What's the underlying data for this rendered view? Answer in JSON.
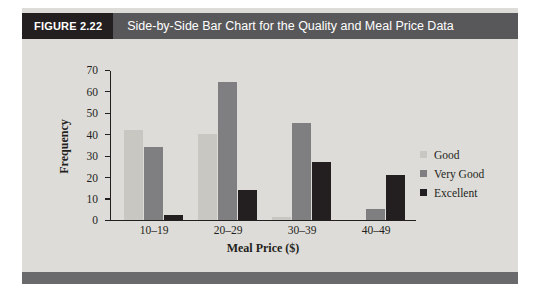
{
  "figure": {
    "tag": "FIGURE 2.22",
    "caption": "Side-by-Side Bar Chart for the Quality and Meal Price Data",
    "tag_bg": "#231f20",
    "band_bg": "#58585a",
    "footer_bg": "#6a6a6c",
    "page_bg": "#dedcd8"
  },
  "chart_data": {
    "type": "bar",
    "title": "Side-by-Side Bar Chart for the Quality and Meal Price Data",
    "xlabel": "Meal Price ($)",
    "ylabel": "Frequency",
    "categories": [
      "10–19",
      "20–29",
      "30–39",
      "40–49"
    ],
    "series": [
      {
        "name": "Good",
        "color": "#c9c7c2",
        "values": [
          42,
          40,
          1,
          0
        ]
      },
      {
        "name": "Very Good",
        "color": "#7f7f81",
        "values": [
          34,
          64,
          45,
          5
        ]
      },
      {
        "name": "Excellent",
        "color": "#231f20",
        "values": [
          2,
          14,
          27,
          21
        ]
      }
    ],
    "ylim": [
      0,
      70
    ],
    "yticks": [
      0,
      10,
      20,
      30,
      40,
      50,
      60,
      70
    ],
    "ytick_labels": [
      "0",
      "10",
      "20",
      "30",
      "40",
      "50",
      "60",
      "70"
    ],
    "grid": false,
    "legend_position": "right"
  }
}
